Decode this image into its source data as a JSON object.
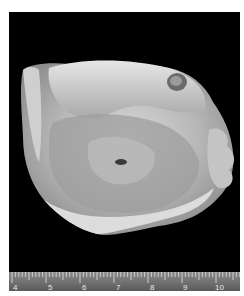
{
  "figure": {
    "colors": {
      "background": "#000000",
      "page": "#ffffff",
      "specimen": "#c8c8c8",
      "ruler": "#7a7a7a"
    }
  },
  "ruler": {
    "unit": "cm",
    "labels": [
      "4",
      "5",
      "6",
      "7",
      "8",
      "9",
      "10"
    ],
    "label_x": [
      12,
      47,
      81,
      115,
      149,
      182,
      214
    ],
    "px_per_cm": 34
  }
}
